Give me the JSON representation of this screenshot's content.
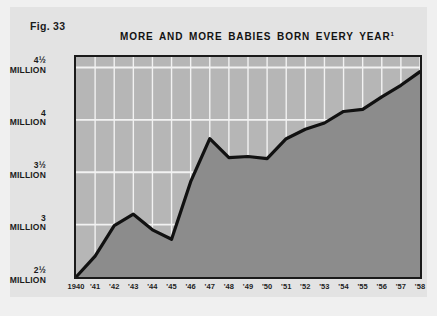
{
  "figure": {
    "label": "Fig. 33",
    "title": "MORE AND MORE BABIES BORN EVERY YEAR",
    "title_note": "1"
  },
  "chart_data": {
    "type": "area",
    "title": "MORE AND MORE BABIES BORN EVERY YEAR",
    "xlabel": "",
    "ylabel": "",
    "grid": true,
    "legend": null,
    "ylim": [
      2.5,
      4.6
    ],
    "xlim": [
      1940,
      1958
    ],
    "y_tick_values": [
      2.5,
      3.0,
      3.5,
      4.0,
      4.5
    ],
    "y_tick_labels": [
      {
        "value": "2½",
        "unit": "MILLION"
      },
      {
        "value": "3",
        "unit": "MILLION"
      },
      {
        "value": "3½",
        "unit": "MILLION"
      },
      {
        "value": "4",
        "unit": "MILLION"
      },
      {
        "value": "4½",
        "unit": "MILLION"
      }
    ],
    "x_tick_labels": [
      "1940",
      "'41",
      "'42",
      "'43",
      "'44",
      "'45",
      "'46",
      "'47",
      "'48",
      "'49",
      "'50",
      "'51",
      "'52",
      "'53",
      "'54",
      "'55",
      "'56",
      "'57",
      "'58"
    ],
    "x": [
      1940,
      1941,
      1942,
      1943,
      1944,
      1945,
      1946,
      1947,
      1948,
      1949,
      1950,
      1951,
      1952,
      1953,
      1954,
      1955,
      1956,
      1957,
      1958
    ],
    "values": [
      2.5,
      2.7,
      2.99,
      3.1,
      2.95,
      2.86,
      3.41,
      3.82,
      3.64,
      3.65,
      3.63,
      3.82,
      3.91,
      3.97,
      4.08,
      4.1,
      4.22,
      4.33,
      4.46
    ],
    "series_name": "Babies born per year",
    "units": "millions"
  },
  "colors": {
    "page_background": "#f0f0f0",
    "panel_background": "#e3e3e3",
    "plot_background": "#b6b6b6",
    "area_fill": "#8c8c8c",
    "line": "#111111",
    "gridline": "#f2f2f2",
    "frame": "#1a1a1a",
    "text": "#1b1b1b"
  }
}
